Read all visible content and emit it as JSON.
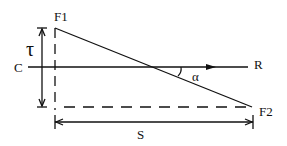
{
  "diagram": {
    "labels": {
      "f1": "F1",
      "f2": "F2",
      "c": "C",
      "r": "R",
      "tau": "τ",
      "alpha": "α",
      "s": "S"
    },
    "colors": {
      "stroke": "#111111",
      "background": "#ffffff"
    }
  }
}
